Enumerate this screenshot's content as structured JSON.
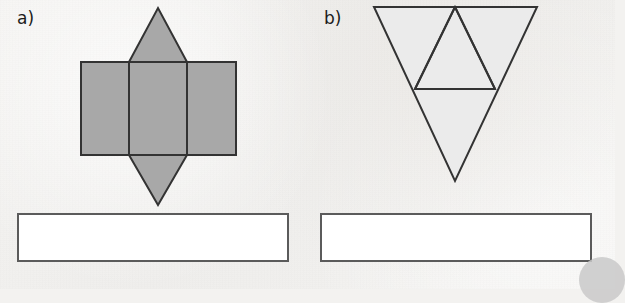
{
  "page": {
    "background_color": "#f3f2f0",
    "width": 615,
    "height": 289
  },
  "style": {
    "net_a_fill": "#a8a8a8",
    "net_b_fill": "#ebebeb",
    "stroke_color": "#333333",
    "answer_box_fill": "#ffffff",
    "answer_box_border": "#5b5b5b",
    "corner_blob_color": "#c9c9c9"
  },
  "items": [
    {
      "id": "a",
      "label": "a)",
      "figure": {
        "name": "net-of-triangular-prism",
        "description": "Three adjoining rectangles in a row with an upward triangle on top of the middle rectangle and a downward triangle below the middle rectangle",
        "fill": "#a8a8a8",
        "stroke": "#333333",
        "stroke_width": 2,
        "shapes": [
          {
            "type": "rect",
            "name": "left-rectangle",
            "x": 81,
            "y": 62,
            "width": 48,
            "height": 93
          },
          {
            "type": "rect",
            "name": "middle-rectangle",
            "x": 129,
            "y": 62,
            "width": 58,
            "height": 93
          },
          {
            "type": "rect",
            "name": "right-rectangle",
            "x": 187,
            "y": 62,
            "width": 49,
            "height": 93
          },
          {
            "type": "polygon",
            "name": "top-triangle",
            "points": "129,62 158,8 187,62"
          },
          {
            "type": "polygon",
            "name": "bottom-triangle",
            "points": "129,155 158,205 187,155"
          }
        ]
      },
      "answer_box": {
        "name": "answer-box",
        "value": "",
        "placeholder": ""
      }
    },
    {
      "id": "b",
      "label": "b)",
      "figure": {
        "name": "net-of-tetrahedron",
        "description": "Large downward-pointing triangle subdivided into four smaller triangles",
        "fill": "#ebebeb",
        "stroke": "#333333",
        "stroke_width": 2,
        "shapes": [
          {
            "type": "polygon",
            "name": "outer-triangle",
            "points": "67,7 230,7 148,181"
          },
          {
            "type": "polygon",
            "name": "inner-middle-triangle",
            "points": "108,89 188,89 148,7"
          },
          {
            "type": "line",
            "name": "inner-left-edge",
            "x1": 108,
            "y1": 89,
            "x2": 148,
            "y2": 7
          },
          {
            "type": "line",
            "name": "inner-right-edge",
            "x1": 188,
            "y1": 89,
            "x2": 148,
            "y2": 7
          },
          {
            "type": "line",
            "name": "inner-horizontal-edge",
            "x1": 108,
            "y1": 89,
            "x2": 188,
            "y2": 89
          }
        ]
      },
      "answer_box": {
        "name": "answer-box",
        "value": "",
        "placeholder": ""
      }
    }
  ]
}
